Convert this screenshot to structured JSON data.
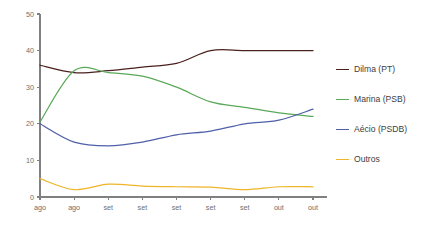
{
  "chart_data": {
    "type": "line",
    "title": "",
    "subtitle": "",
    "xlabel": "",
    "ylabel": "",
    "ylim": [
      0,
      50
    ],
    "yticks": [
      0,
      10,
      20,
      30,
      40,
      50
    ],
    "ytick_labels": [
      "0",
      "10",
      "20",
      "30",
      "40",
      "50"
    ],
    "categories": [
      "ago",
      "ago",
      "set",
      "set",
      "set",
      "set",
      "set",
      "out",
      "out"
    ],
    "grid": false,
    "legend_position": "right",
    "series": [
      {
        "name": "Dilma (PT)",
        "color": "#4a211c",
        "values": [
          36,
          34,
          34.5,
          35.5,
          36.5,
          40,
          40,
          40,
          40
        ]
      },
      {
        "name": "Marina (PSB)",
        "color": "#5aa85a",
        "values": [
          20.5,
          34.5,
          34,
          33,
          30,
          26,
          24.5,
          23,
          22
        ]
      },
      {
        "name": "Aécio (PSDB)",
        "color": "#4f5fa8",
        "values": [
          20,
          15,
          14,
          15,
          17,
          18,
          20,
          21,
          24
        ]
      },
      {
        "name": "Outros",
        "color": "#f0b429",
        "values": [
          5,
          2,
          3.5,
          3,
          2.8,
          2.7,
          2,
          2.8,
          2.8
        ]
      }
    ]
  },
  "legend": {
    "items": [
      {
        "label": "Dilma (PT)",
        "color": "#4a211c",
        "swatch_name": "legend-swatch-dilma"
      },
      {
        "label": "Marina (PSB)",
        "color": "#5aa85a",
        "swatch_name": "legend-swatch-marina"
      },
      {
        "label": "Aécio (PSDB)",
        "color": "#4f5fa8",
        "swatch_name": "legend-swatch-aecio"
      },
      {
        "label": "Outros",
        "color": "#f0b429",
        "swatch_name": "legend-swatch-outros"
      }
    ]
  },
  "axes": {
    "axis_color": "#808080",
    "tick_label_color": "#6e6e6e"
  }
}
